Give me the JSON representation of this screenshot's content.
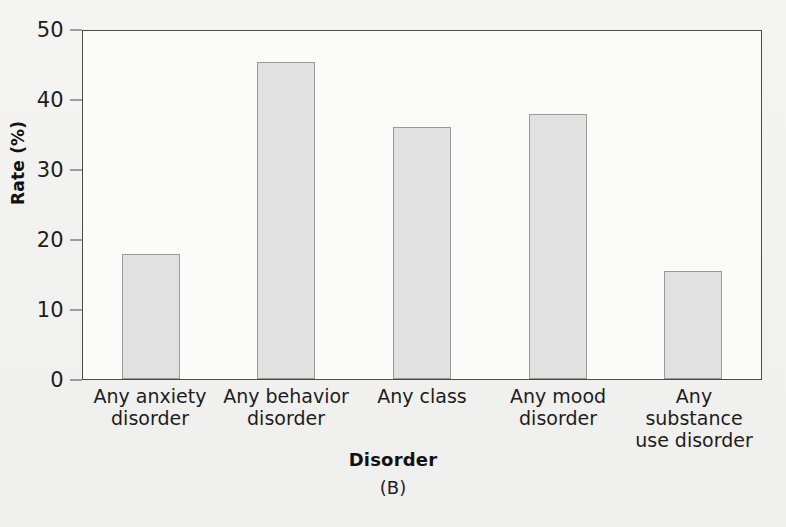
{
  "chart_data": {
    "type": "bar",
    "title": "",
    "xlabel": "Disorder",
    "ylabel": "Rate (%)",
    "panel_label": "(B)",
    "categories": [
      "Any anxiety disorder",
      "Any behavior disorder",
      "Any class",
      "Any mood disorder",
      "Any substance use disorder"
    ],
    "category_lines": [
      [
        "Any anxiety",
        "disorder"
      ],
      [
        "Any behavior",
        "disorder"
      ],
      [
        "Any class",
        ""
      ],
      [
        "Any mood",
        "disorder"
      ],
      [
        "Any substance",
        "use disorder"
      ]
    ],
    "values": [
      17.8,
      45.3,
      36.0,
      37.8,
      15.5
    ],
    "ylim": [
      0,
      50
    ],
    "yticks": [
      0,
      10,
      20,
      30,
      40,
      50
    ],
    "ytick_labels": [
      "0",
      "10",
      "20",
      "30",
      "40",
      "50"
    ],
    "grid": false,
    "legend": false,
    "bar_fill": "#e1e1e1",
    "bar_border": "#9a9a9a",
    "axis_color": "#4a4a4a",
    "plot_background": "#fbfbfa",
    "figure_background": "#f2f2f0"
  }
}
